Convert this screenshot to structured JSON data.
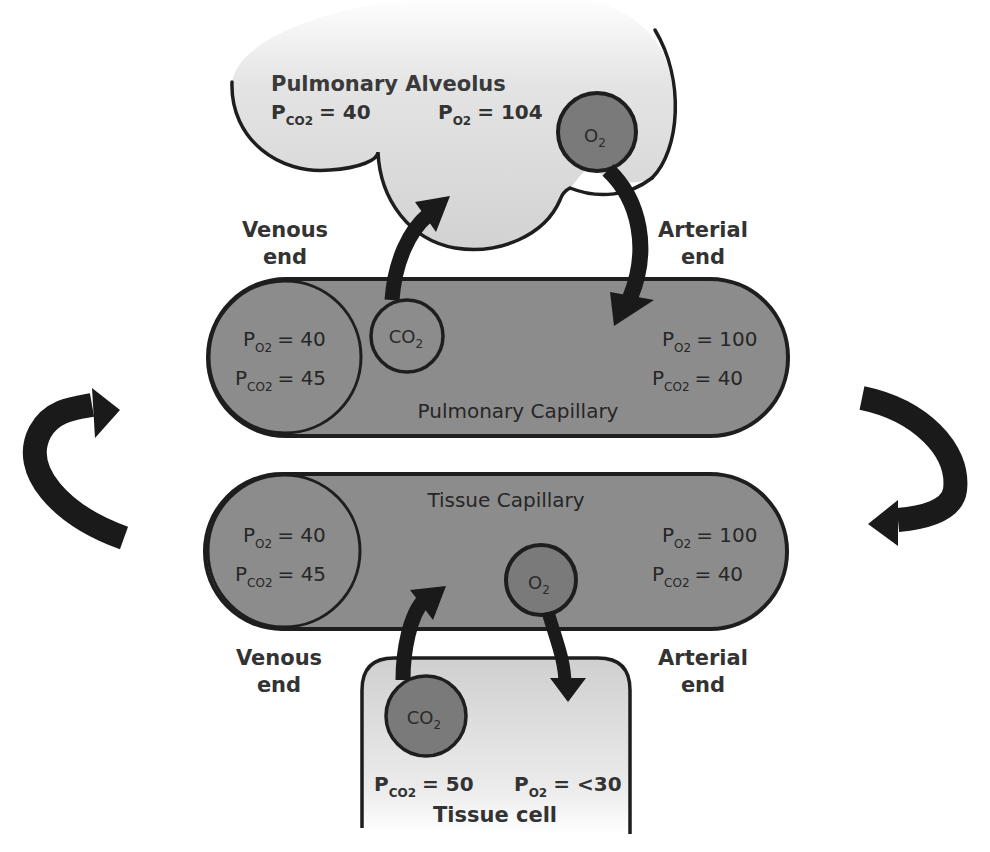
{
  "diagram": {
    "colors": {
      "alveolus_fill": "#dcdcdc",
      "tissue_cell_fill": "#e2e2e2",
      "capillary_fill": "#8c8c8c",
      "molecule_fill": "#7a7a7a",
      "outline": "#1e1e1e",
      "arrow": "#1a1a1a",
      "background": "#ffffff"
    }
  },
  "alveolus": {
    "name": "Pulmonary Alveolus",
    "pco2_label": "P",
    "pco2_sub": "CO2",
    "pco2_value": "= 40",
    "po2_label": "P",
    "po2_sub": "O2",
    "po2_value": "= 104",
    "molecule": {
      "symbol": "O",
      "sub": "2"
    }
  },
  "pulmonary_capillary": {
    "name": "Pulmonary Capillary",
    "venous_end": {
      "line1": "Venous",
      "line2": "end",
      "po2": "= 40",
      "pco2": "= 45"
    },
    "arterial_end": {
      "line1": "Arterial",
      "line2": "end",
      "po2": "= 100",
      "pco2": "= 40"
    },
    "molecule": {
      "symbol": "CO",
      "sub": "2"
    }
  },
  "tissue_capillary": {
    "name": "Tissue Capillary",
    "venous_end": {
      "line1": "Venous",
      "line2": "end",
      "po2": "= 40",
      "pco2": "= 45"
    },
    "arterial_end": {
      "line1": "Arterial",
      "line2": "end",
      "po2": "= 100",
      "pco2": "= 40"
    },
    "molecule": {
      "symbol": "O",
      "sub": "2"
    }
  },
  "tissue_cell": {
    "name": "Tissue cell",
    "pco2_value": "= 50",
    "po2_value": "= <30",
    "molecule": {
      "symbol": "CO",
      "sub": "2"
    }
  },
  "labels": {
    "P": "P",
    "sub_o2": "O2",
    "sub_co2": "CO2"
  },
  "arrows": [
    {
      "name": "co2-to-alveolus",
      "direction": "up"
    },
    {
      "name": "o2-to-pulmonary-capillary",
      "direction": "down"
    },
    {
      "name": "co2-to-tissue-capillary",
      "direction": "up"
    },
    {
      "name": "o2-to-tissue-cell",
      "direction": "down"
    },
    {
      "name": "venous-return-left",
      "direction": "up"
    },
    {
      "name": "arterial-flow-right",
      "direction": "down"
    }
  ]
}
